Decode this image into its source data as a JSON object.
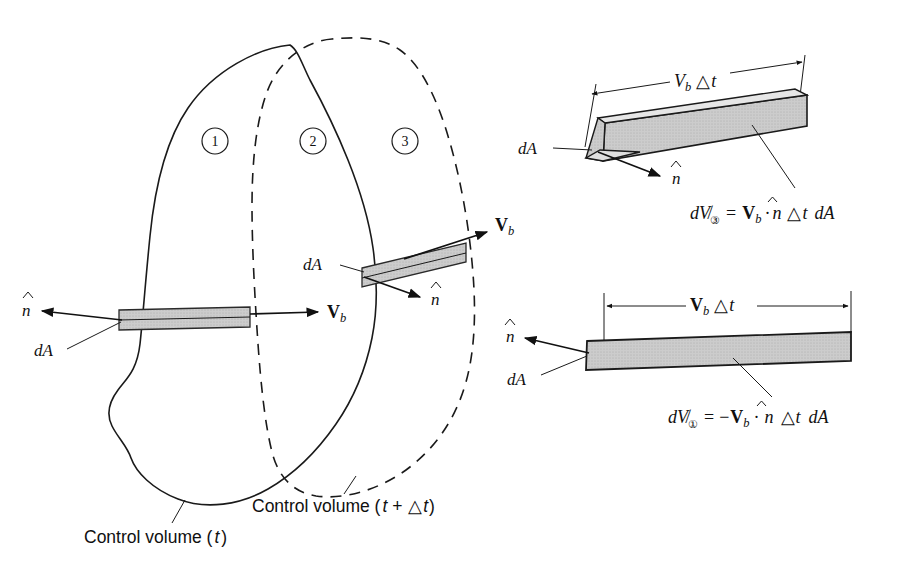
{
  "figure": {
    "type": "technical-diagram",
    "background_color": "#ffffff",
    "line_color": "#1a1a1a",
    "shade_color": "#c9c9c9"
  },
  "regions": [
    {
      "id": "region-1",
      "label": "1"
    },
    {
      "id": "region-2",
      "label": "2"
    },
    {
      "id": "region-3",
      "label": "3"
    }
  ],
  "captions": {
    "control_volume_t": "Control volume (",
    "control_volume_t_var": "t",
    "control_volume_t_close": ")",
    "control_volume_tdt": "Control volume (",
    "control_volume_tdt_var": "t",
    "control_volume_tdt_plus": " + ",
    "control_volume_tdt_delta": "△",
    "control_volume_tdt_var2": "t",
    "control_volume_tdt_close": ")"
  },
  "main_diagram": {
    "labels": {
      "n_hat_left": "n",
      "dA_left": "dA",
      "Vb_left": "V",
      "Vb_left_sub": "b",
      "dA_mid": "dA",
      "n_hat_mid": "n",
      "Vb_mid": "V",
      "Vb_mid_sub": "b"
    }
  },
  "inset_top": {
    "name": "outflow-slab-region-3",
    "dimension_label_V": "V",
    "dimension_label_sub": "b",
    "dimension_label_delta": "△",
    "dimension_label_t": "t",
    "dA_label": "dA",
    "n_hat_label": "n",
    "equation": {
      "d": "d",
      "volume_symbol": "V̸",
      "subscript": "③",
      "equals": "=",
      "Vb": "V",
      "Vb_sub": "b",
      "dot": "·",
      "n_hat": "n",
      "delta": "△",
      "t": "t",
      "dA": "dA",
      "plain_text": "dV③ = Vb · n̂ △t dA"
    }
  },
  "inset_bottom": {
    "name": "inflow-slab-region-1",
    "dimension_label_V": "V",
    "dimension_label_sub": "b",
    "dimension_label_delta": "△",
    "dimension_label_t": "t",
    "dA_label": "dA",
    "n_hat_label": "n",
    "equation": {
      "d": "d",
      "volume_symbol": "V̸",
      "subscript": "①",
      "equals": "=",
      "minus": "−",
      "Vb": "V",
      "Vb_sub": "b",
      "dot": "·",
      "n_hat": "n",
      "delta": "△",
      "t": "t",
      "dA": "dA",
      "plain_text": "dV① = −Vb · n̂ △t dA"
    }
  }
}
